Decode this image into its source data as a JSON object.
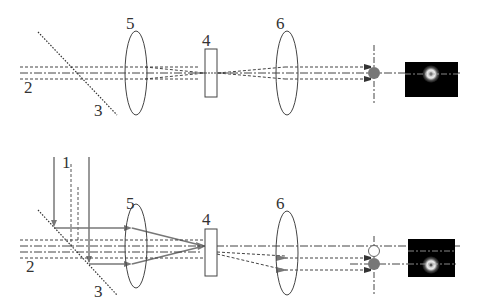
{
  "diagram": {
    "type": "optical-setup",
    "panels": [
      {
        "id": "top",
        "labels": {
          "beam": "2",
          "splitter": "3",
          "lens1": "5",
          "sample": "4",
          "lens2": "6"
        }
      },
      {
        "id": "bottom",
        "labels": {
          "pump": "1",
          "beam": "2",
          "splitter": "3",
          "lens1": "5",
          "sample": "4",
          "lens2": "6"
        }
      }
    ],
    "colors": {
      "line": "#333333",
      "beam_solid": "#777777",
      "image_bg": "#000000",
      "ring": "#dddddd"
    }
  }
}
